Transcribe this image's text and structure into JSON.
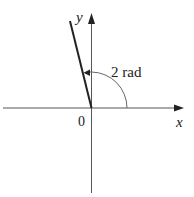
{
  "diagram": {
    "type": "angle-in-standard-position",
    "axes": {
      "x_label": "x",
      "y_label": "y",
      "origin_label": "0"
    },
    "angle": {
      "label": "2 rad",
      "value_rad": 2,
      "direction": "counterclockwise"
    },
    "colors": {
      "axis": "#555555",
      "terminal_side": "#222222",
      "arc": "#666666",
      "text": "#222222"
    }
  }
}
